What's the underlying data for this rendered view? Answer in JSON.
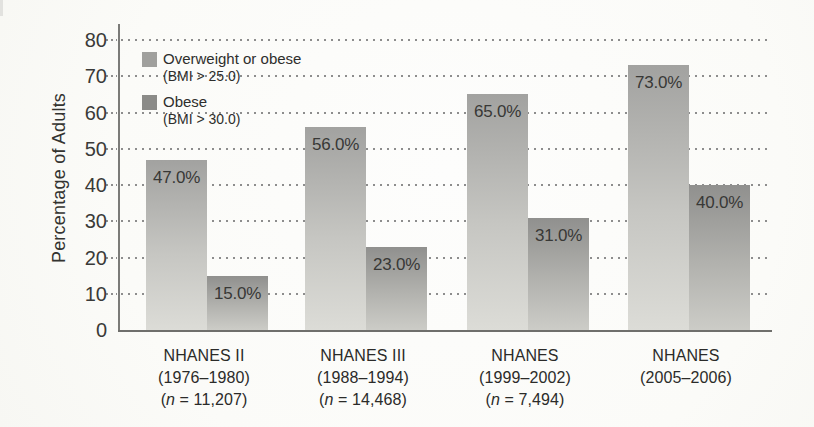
{
  "chart_data": {
    "type": "bar",
    "title": "",
    "xlabel": "",
    "ylabel": "Percentage of Adults",
    "ylim": [
      0,
      80
    ],
    "yticks": [
      0,
      10,
      20,
      30,
      40,
      50,
      60,
      70,
      80
    ],
    "grid": "dotted-horizontal",
    "legend_position": "top-left-inside",
    "categories": [
      {
        "lines": [
          "NHANES II",
          "(1976–1980)",
          "(n = 11,207)"
        ]
      },
      {
        "lines": [
          "NHANES III",
          "(1988–1994)",
          "(n = 14,468)"
        ]
      },
      {
        "lines": [
          "NHANES",
          "(1999–2002)",
          "(n = 7,494)"
        ]
      },
      {
        "lines": [
          "NHANES",
          "(2005–2006)"
        ]
      }
    ],
    "series": [
      {
        "name": "Overweight or obese",
        "sublabel": "(BMI > 25.0)",
        "values": [
          47.0,
          56.0,
          65.0,
          73.0
        ],
        "labels": [
          "47.0%",
          "56.0%",
          "65.0%",
          "73.0%"
        ],
        "swatch_color": "#a0a09d",
        "bar_color_top": "#a2a2a0",
        "bar_color_bottom": "#dcdcd7"
      },
      {
        "name": "Obese",
        "sublabel": "(BMI > 30.0)",
        "values": [
          15.0,
          23.0,
          31.0,
          40.0
        ],
        "labels": [
          "15.0%",
          "23.0%",
          "31.0%",
          "40.0%"
        ],
        "swatch_color": "#8b8b88",
        "bar_color_top": "#90908e",
        "bar_color_bottom": "#ccccc7"
      }
    ],
    "colors": {
      "grid": "#8d8d8d",
      "axis": "#6f6f6c",
      "text": "#2b2b29"
    }
  }
}
